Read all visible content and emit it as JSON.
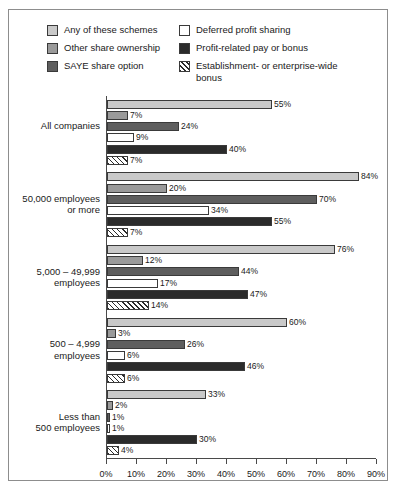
{
  "chart_data": {
    "type": "bar",
    "orientation": "horizontal",
    "title": "",
    "xlabel": "",
    "ylabel": "",
    "xlim": [
      0,
      90
    ],
    "xticks": [
      "0%",
      "10%",
      "20%",
      "30%",
      "40%",
      "50%",
      "60%",
      "70%",
      "80%",
      "90%"
    ],
    "grid": false,
    "legend_position": "top",
    "value_suffix": "%",
    "categories": [
      "All companies",
      "50,000 employees\nor more",
      "5,000 – 49,999\nemployees",
      "500 – 4,999\nemployees",
      "Less than\n500 employees"
    ],
    "series": [
      {
        "name": "Any of these schemes",
        "color": "#c9c9c9",
        "pattern": "solid",
        "values": [
          55,
          84,
          76,
          60,
          33
        ],
        "labels": [
          "55%",
          "84%",
          "76%",
          "60%",
          "33%"
        ]
      },
      {
        "name": "Other share ownership",
        "color": "#9a9a9a",
        "pattern": "solid",
        "values": [
          7,
          20,
          12,
          3,
          2
        ],
        "labels": [
          "7%",
          "20%",
          "12%",
          "3%",
          "2%"
        ]
      },
      {
        "name": "SAYE share option",
        "color": "#5e5e5e",
        "pattern": "solid",
        "values": [
          24,
          70,
          44,
          26,
          1
        ],
        "labels": [
          "24%",
          "70%",
          "44%",
          "26%",
          "1%"
        ]
      },
      {
        "name": "Deferred profit sharing",
        "color": "#ffffff",
        "pattern": "solid",
        "values": [
          9,
          34,
          17,
          6,
          1
        ],
        "labels": [
          "9%",
          "34%",
          "17%",
          "6%",
          "1%"
        ]
      },
      {
        "name": "Profit-related pay or bonus",
        "color": "#2b2b2b",
        "pattern": "solid",
        "values": [
          40,
          55,
          47,
          46,
          30
        ],
        "labels": [
          "40%",
          "55%",
          "47%",
          "46%",
          "30%"
        ]
      },
      {
        "name": "Establishment- or enterprise-wide\nbonus",
        "color": "#ffffff",
        "pattern": "diagonal-hatch",
        "values": [
          7,
          7,
          14,
          6,
          4
        ],
        "labels": [
          "7%",
          "7%",
          "14%",
          "6%",
          "4%"
        ]
      }
    ]
  }
}
